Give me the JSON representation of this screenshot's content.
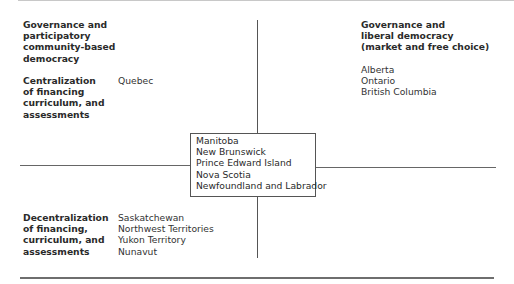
{
  "top_left": {
    "heading": [
      "Governance and",
      "participatory",
      "community-based",
      "democracy"
    ],
    "category": [
      "Centralization",
      "of financing",
      "curriculum, and",
      "assessments"
    ],
    "provinces": [
      "Quebec"
    ]
  },
  "top_right": {
    "heading": [
      "Governance and",
      "liberal democracy",
      "(market and free choice)"
    ],
    "provinces": [
      "Alberta",
      "Ontario",
      "British Columbia"
    ]
  },
  "center": {
    "provinces": [
      "Manitoba",
      "New Brunswick",
      "Prince Edward Island",
      "Nova Scotia",
      "Newfoundland and Labrador"
    ]
  },
  "bottom_left": {
    "category": [
      "Decentralization",
      "of financing,",
      "curriculum, and",
      "assessments"
    ],
    "provinces": [
      "Saskatchewan",
      "Northwest Territories",
      "Yukon Territory",
      "Nunavut"
    ]
  }
}
